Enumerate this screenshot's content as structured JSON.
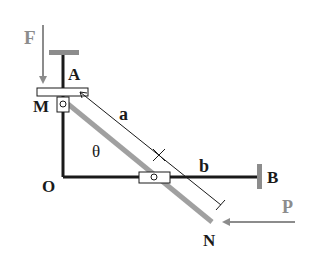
{
  "labels": {
    "F": "F",
    "A": "A",
    "M": "M",
    "a": "a",
    "theta": "θ",
    "O": "O",
    "b": "b",
    "B": "B",
    "P": "P",
    "N": "N"
  },
  "colors": {
    "black": "#1a1a1a",
    "gray": "#8c8c8c",
    "light_gray": "#a0a0a0"
  }
}
